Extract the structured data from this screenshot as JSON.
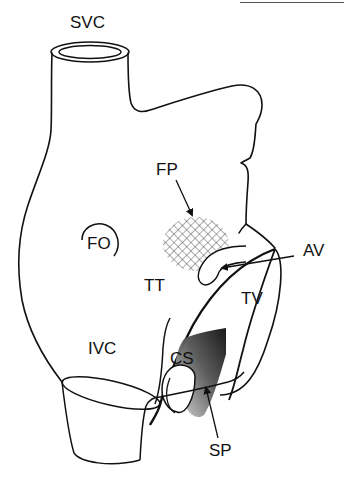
{
  "diagram": {
    "labels": {
      "svc": "SVC",
      "fp": "FP",
      "fo": "FO",
      "av": "AV",
      "tt": "TT",
      "tv": "TV",
      "ivc": "IVC",
      "cs": "CS",
      "sp": "SP"
    },
    "colors": {
      "stroke": "#111111",
      "background": "#ffffff",
      "shading_dark": "#1a1a1a",
      "shading_light": "#e6e6e6",
      "hatch": "#333333"
    }
  }
}
